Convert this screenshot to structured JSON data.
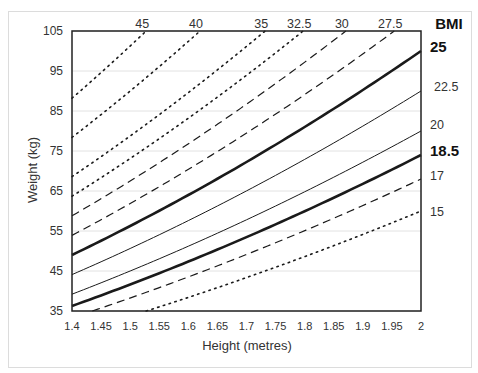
{
  "chart_data": {
    "type": "line",
    "title": "",
    "xlabel": "Height (metres)",
    "ylabel": "Weight (kg)",
    "xlim": [
      1.4,
      2.0
    ],
    "ylim": [
      35,
      105
    ],
    "x_ticks": [
      "1.4",
      "1.45",
      "1.5",
      "1.55",
      "1.6",
      "1.65",
      "1.7",
      "1.75",
      "1.8",
      "1.85",
      "1.9",
      "1.95",
      "2"
    ],
    "y_ticks": [
      "35",
      "45",
      "55",
      "65",
      "75",
      "85",
      "95",
      "105"
    ],
    "grid": "horizontal",
    "legend_title": "BMI",
    "formula": "weight = BMI * height^2",
    "series": [
      {
        "name": "45",
        "bmi": 45,
        "style": "dotted",
        "label_pos": "top"
      },
      {
        "name": "40",
        "bmi": 40,
        "style": "dotted",
        "label_pos": "top"
      },
      {
        "name": "35",
        "bmi": 35,
        "style": "dotted",
        "label_pos": "top"
      },
      {
        "name": "32.5",
        "bmi": 32.5,
        "style": "dotted",
        "label_pos": "top"
      },
      {
        "name": "30",
        "bmi": 30,
        "style": "dashed",
        "label_pos": "top"
      },
      {
        "name": "27.5",
        "bmi": 27.5,
        "style": "dashed",
        "label_pos": "top"
      },
      {
        "name": "25",
        "bmi": 25,
        "style": "bold",
        "label_pos": "right"
      },
      {
        "name": "22.5",
        "bmi": 22.5,
        "style": "thin",
        "label_pos": "right"
      },
      {
        "name": "20",
        "bmi": 20,
        "style": "thin",
        "label_pos": "right"
      },
      {
        "name": "18.5",
        "bmi": 18.5,
        "style": "bold",
        "label_pos": "right"
      },
      {
        "name": "17",
        "bmi": 17,
        "style": "dashed",
        "label_pos": "right"
      },
      {
        "name": "15",
        "bmi": 15,
        "style": "dotted",
        "label_pos": "right"
      }
    ]
  }
}
